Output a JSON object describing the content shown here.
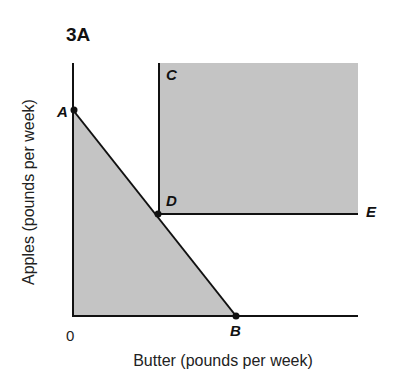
{
  "figure": {
    "title": "3A",
    "x_axis_label": "Butter (pounds per week)",
    "y_axis_label": "Apples (pounds per week)",
    "origin_label": "0",
    "points": {
      "A": "A",
      "B": "B",
      "C": "C",
      "D": "D",
      "E": "E"
    },
    "colors": {
      "shade": "#c4c4c4",
      "line": "#111111"
    }
  }
}
